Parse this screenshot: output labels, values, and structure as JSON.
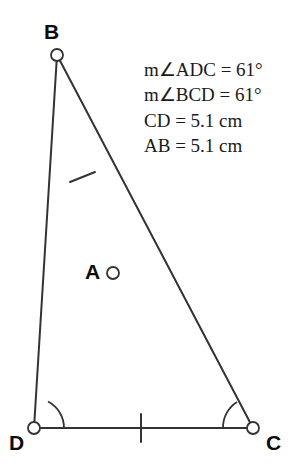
{
  "figure": {
    "type": "geometry-diagram",
    "width": 301,
    "height": 468,
    "background_color": "#ffffff",
    "stroke_color": "#333333",
    "label_color": "#0d0d0d",
    "text_color": "#1a1a1a"
  },
  "vertices": [
    {
      "id": "B",
      "label": "B",
      "x": 57,
      "y": 55,
      "label_x": 44,
      "label_y": 21,
      "marker": "open-circle"
    },
    {
      "id": "A",
      "label": "A",
      "x": 113,
      "y": 273,
      "label_x": 85,
      "label_y": 261,
      "marker": "open-circle"
    },
    {
      "id": "D",
      "label": "D",
      "x": 34,
      "y": 428,
      "label_x": 9,
      "label_y": 432,
      "marker": "open-circle"
    },
    {
      "id": "C",
      "label": "C",
      "x": 253,
      "y": 428,
      "label_x": 266,
      "label_y": 432,
      "marker": "open-circle"
    }
  ],
  "segments": [
    {
      "id": "BD",
      "from": "B",
      "to": "D",
      "through": "A"
    },
    {
      "id": "BC",
      "from": "B",
      "to": "C"
    },
    {
      "id": "DC",
      "from": "D",
      "to": "C"
    }
  ],
  "tick_marks": [
    {
      "id": "tick-BA",
      "on_segment": "BA",
      "x": 82,
      "y": 177,
      "count": 1
    },
    {
      "id": "tick-DC",
      "on_segment": "DC",
      "x": 141,
      "y": 428,
      "count": 1
    }
  ],
  "angle_arcs": [
    {
      "id": "arc-D",
      "at_vertex": "D",
      "radius": 30
    },
    {
      "id": "arc-C",
      "at_vertex": "C",
      "radius": 30
    }
  ],
  "measurements": {
    "lines": [
      "m∠ADC = 61°",
      "m∠BCD = 61°",
      "CD = 5.1 cm",
      "AB = 5.1 cm"
    ],
    "line_1": "m∠ADC = 61°",
    "line_2": "m∠BCD = 61°",
    "line_3": "CD = 5.1 cm",
    "line_4": "AB = 5.1 cm"
  }
}
